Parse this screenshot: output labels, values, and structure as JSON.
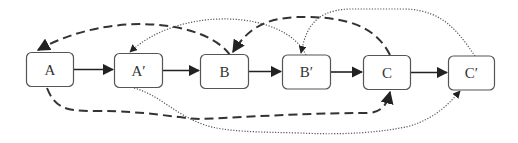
{
  "diagram": {
    "nodes": [
      {
        "id": "A",
        "label": "A"
      },
      {
        "id": "A2",
        "label": "A′"
      },
      {
        "id": "B",
        "label": "B"
      },
      {
        "id": "B2",
        "label": "B′"
      },
      {
        "id": "C",
        "label": "C"
      },
      {
        "id": "C2",
        "label": "C′"
      }
    ],
    "edges": [
      {
        "from": "A",
        "to": "A′",
        "style": "solid"
      },
      {
        "from": "A′",
        "to": "B",
        "style": "solid"
      },
      {
        "from": "B",
        "to": "B′",
        "style": "solid"
      },
      {
        "from": "B′",
        "to": "C",
        "style": "solid"
      },
      {
        "from": "C",
        "to": "C′",
        "style": "solid"
      },
      {
        "from": "B",
        "to": "A",
        "style": "dashed",
        "route": "over"
      },
      {
        "from": "B′",
        "to": "A′",
        "style": "dotted",
        "route": "over"
      },
      {
        "from": "C",
        "to": "B",
        "style": "dashed",
        "route": "over"
      },
      {
        "from": "C′",
        "to": "B′",
        "style": "dotted",
        "route": "over"
      },
      {
        "from": "A",
        "to": "C",
        "style": "dashed",
        "route": "under"
      },
      {
        "from": "A′",
        "to": "C′",
        "style": "dotted",
        "route": "under"
      }
    ],
    "colors": {
      "node_border": "#555555",
      "edge": "#222222",
      "label": "#333333",
      "background": "#ffffff"
    }
  }
}
